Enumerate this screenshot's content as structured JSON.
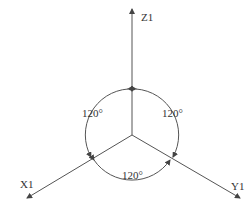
{
  "diagram": {
    "axes": [
      {
        "label": "Z1",
        "direction": "up"
      },
      {
        "label": "X1",
        "direction": "lower-left"
      },
      {
        "label": "Y1",
        "direction": "lower-right"
      }
    ],
    "angles": [
      {
        "label": "120°",
        "between": [
          "Z1",
          "X1"
        ]
      },
      {
        "label": "120°",
        "between": [
          "Z1",
          "Y1"
        ]
      },
      {
        "label": "120°",
        "between": [
          "X1",
          "Y1"
        ]
      }
    ],
    "colors": {
      "line": "#555555",
      "text": "#333333"
    }
  }
}
